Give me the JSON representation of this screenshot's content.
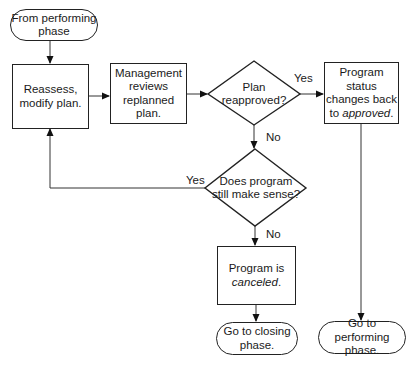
{
  "diagram": {
    "type": "flowchart",
    "nodes": {
      "start": {
        "shape": "terminator",
        "text": "From performing\nphase"
      },
      "reassess": {
        "shape": "process",
        "text": "Reassess,\nmodify plan."
      },
      "management": {
        "shape": "process",
        "text": "Management\nreviews\nreplanned plan."
      },
      "reapproved": {
        "shape": "decision",
        "text": "Plan\nreapproved?"
      },
      "status": {
        "shape": "process",
        "text_line1": "Program status",
        "text_line2": "changes back",
        "text_line3_prefix": "to ",
        "text_line3_italic": "approved",
        "text_line3_suffix": "."
      },
      "sense": {
        "shape": "decision",
        "text": "Does program\nstill make sense?"
      },
      "canceled": {
        "shape": "process",
        "text_line1": "Program is",
        "text_line2_italic": "canceled",
        "text_line2_suffix": "."
      },
      "closing": {
        "shape": "terminator",
        "text": "Go to closing\nphase."
      },
      "performing": {
        "shape": "terminator",
        "text": "Go to performing\nphase."
      }
    },
    "edge_labels": {
      "reapproved_yes": "Yes",
      "reapproved_no": "No",
      "sense_yes": "Yes",
      "sense_no": "No"
    },
    "edges": [
      {
        "from": "start",
        "to": "reassess"
      },
      {
        "from": "reassess",
        "to": "management"
      },
      {
        "from": "management",
        "to": "reapproved"
      },
      {
        "from": "reapproved",
        "to": "status",
        "label": "Yes"
      },
      {
        "from": "reapproved",
        "to": "sense",
        "label": "No"
      },
      {
        "from": "sense",
        "to": "reassess",
        "label": "Yes"
      },
      {
        "from": "sense",
        "to": "canceled",
        "label": "No"
      },
      {
        "from": "canceled",
        "to": "closing"
      },
      {
        "from": "status",
        "to": "performing"
      }
    ]
  }
}
